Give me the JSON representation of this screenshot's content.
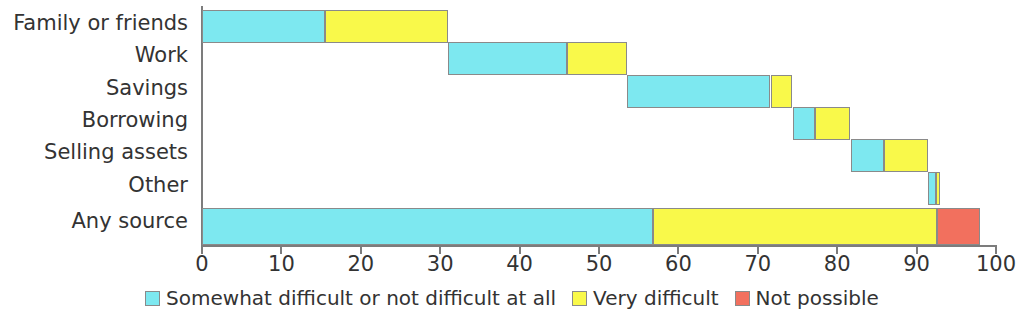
{
  "chart_data": {
    "type": "bar",
    "orientation": "horizontal",
    "stacked": true,
    "title": "",
    "subtitle": "",
    "xlabel": "",
    "ylabel": "",
    "xlim": [
      0,
      100
    ],
    "xticks": [
      0,
      10,
      20,
      30,
      40,
      50,
      60,
      70,
      80,
      90,
      100
    ],
    "xtick_labels": [
      "0",
      "10",
      "20",
      "30",
      "40",
      "50",
      "60",
      "70",
      "80",
      "90",
      "100"
    ],
    "grid": false,
    "legend_position": "bottom",
    "categories": [
      "Family or friends",
      "Work",
      "Savings",
      "Borrowing",
      "Selling assets",
      "Other",
      "Any source"
    ],
    "series": [
      {
        "name": "Somewhat difficult or not difficult at all",
        "color": "#7DE8F0",
        "values": [
          15.5,
          15.0,
          18.1,
          2.8,
          4.2,
          1.0,
          56.8
        ]
      },
      {
        "name": "Very difficult",
        "color": "#F9F94A",
        "values": [
          15.5,
          7.5,
          2.7,
          4.4,
          5.5,
          0.6,
          35.8
        ]
      },
      {
        "name": "Not possible",
        "color": "#F2705E",
        "values": [
          0,
          0,
          0,
          0,
          0,
          0,
          5.4
        ]
      }
    ],
    "bar_offsets": [
      0,
      31.0,
      53.5,
      74.4,
      81.7,
      91.4,
      0
    ],
    "segment_ranges": [
      {
        "category": "Family or friends",
        "somewhat": [
          0,
          15.5
        ],
        "very": [
          15.5,
          31.0
        ],
        "not_possible": null
      },
      {
        "category": "Work",
        "somewhat": [
          31.0,
          46.0
        ],
        "very": [
          46.0,
          53.5
        ],
        "not_possible": null
      },
      {
        "category": "Savings",
        "somewhat": [
          53.5,
          71.6
        ],
        "very": [
          71.6,
          74.3
        ],
        "not_possible": null
      },
      {
        "category": "Borrowing",
        "somewhat": [
          74.4,
          77.2
        ],
        "very": [
          77.2,
          81.6
        ],
        "not_possible": null
      },
      {
        "category": "Selling assets",
        "somewhat": [
          81.7,
          85.9
        ],
        "very": [
          85.9,
          91.4
        ],
        "not_possible": null
      },
      {
        "category": "Other",
        "somewhat": [
          91.4,
          92.4
        ],
        "very": [
          92.4,
          93.0
        ],
        "not_possible": null
      },
      {
        "category": "Any source",
        "somewhat": [
          0,
          56.8
        ],
        "very": [
          56.8,
          92.6
        ],
        "not_possible": [
          92.6,
          98.0
        ]
      }
    ]
  },
  "legend": {
    "items": [
      {
        "label": "Somewhat difficult or not difficult at all",
        "color": "#7DE8F0"
      },
      {
        "label": "Very difficult",
        "color": "#F9F94A"
      },
      {
        "label": "Not possible",
        "color": "#F2705E"
      }
    ]
  }
}
